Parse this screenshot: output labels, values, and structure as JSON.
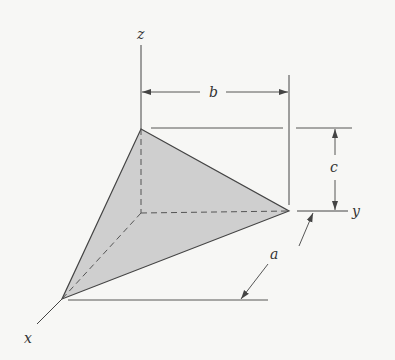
{
  "diagram": {
    "type": "3D tetrahedron with dimension annotations",
    "axes": {
      "x_label": "x",
      "y_label": "y",
      "z_label": "z"
    },
    "dimensions": {
      "a_label": "a",
      "b_label": "b",
      "c_label": "c"
    },
    "colors": {
      "face_fill": "#cfcfcf",
      "line": "#444444",
      "background": "#f7f7f5"
    }
  }
}
